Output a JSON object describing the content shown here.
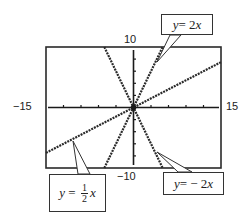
{
  "chart_data": {
    "type": "line",
    "title": "",
    "xlabel": "",
    "ylabel": "",
    "xlim": [
      -15,
      15
    ],
    "ylim": [
      -10,
      10
    ],
    "grid": false,
    "x_tick_step": 3,
    "y_tick_step": 2,
    "tick_labels": {
      "xmin": "−15",
      "xmax": "15",
      "ymax": "10",
      "ymin": "−10"
    },
    "series": [
      {
        "name": "y = 2x",
        "slope": 2,
        "x": [
          -5,
          5
        ],
        "y": [
          -10,
          10
        ],
        "style": "dashed"
      },
      {
        "name": "y = −2x",
        "slope": -2,
        "x": [
          -5,
          5
        ],
        "y": [
          10,
          -10
        ],
        "style": "dashed"
      },
      {
        "name": "y = 1/2 x",
        "slope": 0.5,
        "x": [
          -15,
          15
        ],
        "y": [
          -7.5,
          7.5
        ],
        "style": "dashed"
      }
    ],
    "annotations": [
      {
        "text": "y = 2x",
        "target_series": 0,
        "position": "top-right"
      },
      {
        "text": "y = − 2x",
        "target_series": 1,
        "position": "bottom-right"
      },
      {
        "text": "y = 1/2 x",
        "target_series": 2,
        "position": "bottom-left"
      }
    ]
  },
  "labels": {
    "xmin": "−15",
    "xmax": "15",
    "ymax": "10",
    "ymin": "−10",
    "callout_2x_y": "y",
    "callout_2x_eq": " = 2",
    "callout_2x_x": "x",
    "callout_neg2x_y": "y",
    "callout_neg2x_eq": " = − 2",
    "callout_neg2x_x": "x",
    "callout_half_y": "y",
    "callout_half_eq": " = ",
    "callout_half_num": "1",
    "callout_half_den": "2",
    "callout_half_x": "x"
  },
  "colors": {
    "frame": "#2a2a2a",
    "axis": "#1a1a1a",
    "line": "#2a2a2a",
    "background": "#ffffff"
  }
}
